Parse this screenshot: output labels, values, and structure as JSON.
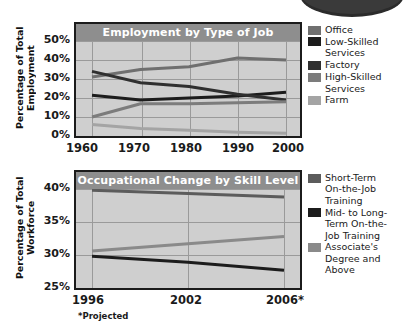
{
  "decor": {
    "top_oval": "rounded-plate-shape"
  },
  "charts": [
    {
      "id": "employment-by-type-of-job",
      "title": "Employment by Type of Job",
      "y_axis_title": "Percentage of Total Employment",
      "y_ticks": [
        "50%",
        "40%",
        "30%",
        "20%",
        "10%",
        "0%"
      ],
      "x_ticks": [
        "1960",
        "1970",
        "1980",
        "1990",
        "2000"
      ],
      "legend": [
        {
          "label": "Office",
          "color": "#6f6f6f"
        },
        {
          "label": "Low-Skilled\nServices",
          "color": "#1c1c1c"
        },
        {
          "label": "Factory",
          "color": "#2f2f2f"
        },
        {
          "label": "High-Skilled\nServices",
          "color": "#7c7c7c"
        },
        {
          "label": "Farm",
          "color": "#a4a4a4"
        }
      ],
      "footnote": ""
    },
    {
      "id": "occupational-change-by-skill-level",
      "title": "Occupational Change by Skill Level",
      "y_axis_title": "Percentage of Total Workforce",
      "y_ticks": [
        "40%",
        "35%",
        "30%",
        "25%"
      ],
      "x_ticks": [
        "1996",
        "2002",
        "2006*"
      ],
      "legend": [
        {
          "label": "Short-Term\nOn-the-Job\nTraining",
          "color": "#5c5c5c"
        },
        {
          "label": "Mid- to Long-\nTerm On-the-\nJob Training",
          "color": "#1c1c1c"
        },
        {
          "label": "Associate's\nDegree and\nAbove",
          "color": "#8a8a8a"
        }
      ],
      "footnote": "*Projected"
    }
  ],
  "chart_data": [
    {
      "type": "line",
      "title": "Employment by Type of Job",
      "xlabel": "",
      "ylabel": "Percentage of Total Employment",
      "x": [
        1960,
        1970,
        1980,
        1990,
        2000
      ],
      "xticklabels": [
        "1960",
        "1970",
        "1980",
        "1990",
        "2000"
      ],
      "ylim": [
        0,
        52
      ],
      "yticks": [
        0,
        10,
        20,
        30,
        40,
        50
      ],
      "yticklabels": [
        "0%",
        "10%",
        "20%",
        "30%",
        "40%",
        "50%"
      ],
      "grid": true,
      "legend_position": "right",
      "series": [
        {
          "name": "Office",
          "color": "#6f6f6f",
          "values": [
            31,
            35,
            36.5,
            41,
            40
          ]
        },
        {
          "name": "Low-Skilled Services",
          "color": "#1c1c1c",
          "values": [
            21.5,
            19,
            20,
            21,
            23
          ]
        },
        {
          "name": "Factory",
          "color": "#2f2f2f",
          "values": [
            34,
            28,
            26,
            22,
            19
          ]
        },
        {
          "name": "High-Skilled Services",
          "color": "#7c7c7c",
          "values": [
            10,
            17,
            17,
            17.5,
            18
          ]
        },
        {
          "name": "Farm",
          "color": "#a4a4a4",
          "values": [
            6,
            4,
            3,
            2,
            1.5
          ]
        }
      ]
    },
    {
      "type": "line",
      "title": "Occupational Change by Skill Level",
      "xlabel": "",
      "ylabel": "Percentage of Total Workforce",
      "x": [
        1996,
        2002,
        2006
      ],
      "xticklabels": [
        "1996",
        "2002",
        "2006*"
      ],
      "ylim": [
        25,
        41
      ],
      "yticks": [
        25,
        30,
        35,
        40
      ],
      "yticklabels": [
        "25%",
        "30%",
        "35%",
        "40%"
      ],
      "grid": true,
      "legend_position": "right",
      "annotation": "*Projected",
      "series": [
        {
          "name": "Short-Term On-the-Job Training",
          "color": "#5c5c5c",
          "values": [
            39.8,
            39.3,
            38.8
          ]
        },
        {
          "name": "Mid- to Long-Term On-the-Job Training",
          "color": "#1c1c1c",
          "values": [
            29.8,
            28.9,
            27.7
          ]
        },
        {
          "name": "Associate's Degree and Above",
          "color": "#8a8a8a",
          "values": [
            30.6,
            31.7,
            32.8
          ]
        }
      ]
    }
  ]
}
